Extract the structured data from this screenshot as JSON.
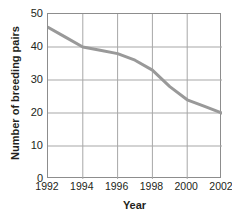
{
  "chart_data": {
    "type": "line",
    "title": "in the Protection Area",
    "xlabel": "Year",
    "ylabel": "Number of breeding pairs",
    "x": [
      1992,
      1993,
      1994,
      1995,
      1996,
      1997,
      1998,
      1999,
      2000,
      2001,
      2002
    ],
    "values": [
      46,
      43,
      40,
      39,
      38,
      36,
      33,
      28,
      24,
      22,
      20
    ],
    "series": [
      {
        "name": "Number of breeding pairs",
        "values": [
          46,
          43,
          40,
          39,
          38,
          36,
          33,
          28,
          24,
          22,
          20
        ]
      }
    ],
    "xlim": [
      1992,
      2002
    ],
    "ylim": [
      0,
      50
    ],
    "xticks": [
      "1992",
      "1994",
      "1996",
      "1998",
      "2000",
      "2002"
    ],
    "yticks": [
      "50",
      "40",
      "30",
      "20",
      "10",
      "0"
    ],
    "grid": true,
    "legend": "none",
    "line_color": "#999999",
    "grid_color": "#8d8d8d",
    "background_color": "#ffffff"
  }
}
